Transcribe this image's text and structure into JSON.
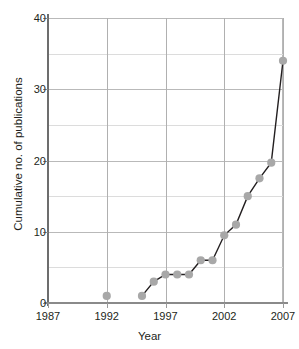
{
  "chart_data": {
    "type": "line",
    "title": "",
    "xlabel": "Year",
    "ylabel": "Cumulative no. of publications",
    "xlim": [
      1987,
      2007
    ],
    "ylim": [
      0,
      40
    ],
    "x_ticks": [
      1987,
      1992,
      1997,
      2002,
      2007
    ],
    "y_ticks": [
      0,
      10,
      20,
      30,
      40
    ],
    "y_gridlines": [
      0,
      5,
      10,
      15,
      20,
      25,
      30,
      35,
      40
    ],
    "grid": "on",
    "legend": "none",
    "marker_color": "#a8a8a8",
    "line_color": "#231f20",
    "series": [
      {
        "name": "isolated point",
        "connected": false,
        "points": [
          {
            "x": 1992,
            "y": 1
          }
        ]
      },
      {
        "name": "Cumulative no. of publications",
        "connected": true,
        "points": [
          {
            "x": 1995,
            "y": 1
          },
          {
            "x": 1996,
            "y": 3
          },
          {
            "x": 1997,
            "y": 4
          },
          {
            "x": 1998,
            "y": 4
          },
          {
            "x": 1999,
            "y": 4
          },
          {
            "x": 2000,
            "y": 6
          },
          {
            "x": 2001,
            "y": 6
          },
          {
            "x": 2002,
            "y": 9.5
          },
          {
            "x": 2003,
            "y": 11
          },
          {
            "x": 2004,
            "y": 15
          },
          {
            "x": 2005,
            "y": 17.5
          },
          {
            "x": 2006,
            "y": 19.7
          },
          {
            "x": 2007,
            "y": 34
          }
        ]
      }
    ]
  }
}
